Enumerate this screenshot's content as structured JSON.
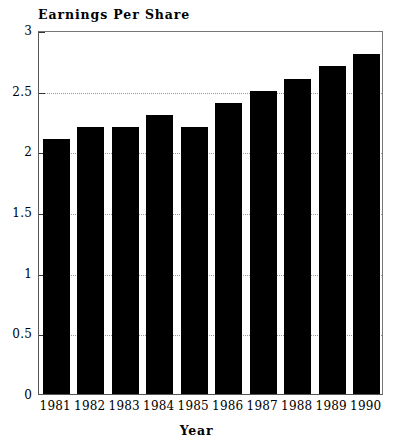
{
  "chart_data": {
    "type": "bar",
    "title": "Earnings Per Share",
    "xlabel": "Year",
    "ylabel": "",
    "categories": [
      "1981",
      "1982",
      "1983",
      "1984",
      "1985",
      "1986",
      "1987",
      "1988",
      "1989",
      "1990"
    ],
    "values": [
      2.1,
      2.2,
      2.2,
      2.3,
      2.2,
      2.4,
      2.5,
      2.6,
      2.7,
      2.8
    ],
    "ylim": [
      0,
      3
    ],
    "ytick_labels": [
      "0",
      "0.5",
      "1",
      "1.5",
      "2",
      "2.5",
      "3"
    ],
    "ytick_values": [
      0,
      0.5,
      1,
      1.5,
      2,
      2.5,
      3
    ],
    "grid": true,
    "grid_axis": "y",
    "legend": false,
    "bar_color": "#000000",
    "background_color": "#ffffff",
    "frame_color": "#555555",
    "gridline_color": "#9a9a9a"
  }
}
